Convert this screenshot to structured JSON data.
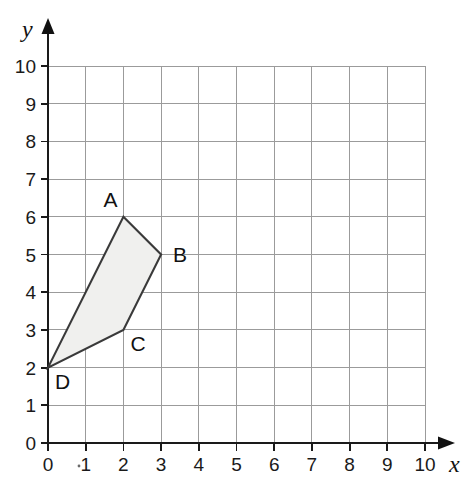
{
  "chart_data": {
    "type": "scatter",
    "title": "",
    "xlabel": "x",
    "ylabel": "y",
    "xlim": [
      0,
      10
    ],
    "ylim": [
      0,
      10
    ],
    "grid": true,
    "legend": "none",
    "x_ticks": [
      "0",
      "1",
      "2",
      "3",
      "4",
      "5",
      "6",
      "7",
      "8",
      "9",
      "10"
    ],
    "y_ticks": [
      "0",
      "1",
      "2",
      "3",
      "4",
      "5",
      "6",
      "7",
      "8",
      "9",
      "10"
    ],
    "shapes": [
      {
        "name": "quadrilateral-ABCD",
        "kind": "polygon",
        "closed": true,
        "fill": "#f0f0ee",
        "stroke": "#3a3a3a",
        "vertices": [
          {
            "label": "A",
            "x": 2,
            "y": 6,
            "label_pos": "above-left"
          },
          {
            "label": "B",
            "x": 3,
            "y": 5,
            "label_pos": "right"
          },
          {
            "label": "C",
            "x": 2,
            "y": 3,
            "label_pos": "below-right"
          },
          {
            "label": "D",
            "x": 0,
            "y": 2,
            "label_pos": "below-right"
          }
        ]
      }
    ],
    "annotations": [
      {
        "text": "A",
        "x": 2,
        "y": 6
      },
      {
        "text": "B",
        "x": 3,
        "y": 5
      },
      {
        "text": "C",
        "x": 2,
        "y": 3
      },
      {
        "text": "D",
        "x": 0,
        "y": 2
      }
    ]
  },
  "axes": {
    "x_axis_name": "x",
    "y_axis_name": "y"
  },
  "colors": {
    "grid": "#9b9b9b",
    "axis": "#1a1a1a",
    "shape_fill": "#f0f0ee",
    "shape_stroke": "#3a3a3a",
    "text": "#111111"
  }
}
